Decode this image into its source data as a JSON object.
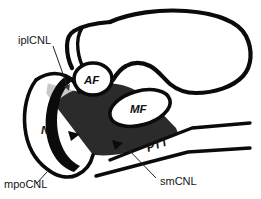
{
  "figure": {
    "background_color": "#ffffff",
    "ink_color": "#0b0b0b",
    "width": 261,
    "height": 199
  },
  "labels": {
    "iplcnl": {
      "text": "iplCNL",
      "full_name": "inferomedial plantar calcaneonavicular ligament",
      "style": "upright",
      "color": "#151515"
    },
    "mpocnl": {
      "text": "mpoCNL",
      "full_name": "medial plantar oblique calcaneonavicular ligament",
      "style": "upright",
      "color": "#151515"
    },
    "smcnl": {
      "text": "smCNL",
      "full_name": "superomedial calcaneonavicular ligament",
      "style": "upright",
      "color": "#151515"
    },
    "ptt": {
      "text": "PTT",
      "full_name": "posterior tibial tendon",
      "style": "italic-bold-rotated",
      "color": "#111111"
    },
    "af": {
      "text": "AF",
      "full_name": "anterior facet",
      "style": "italic-bold",
      "color": "#111111"
    },
    "mf": {
      "text": "MF",
      "full_name": "middle facet",
      "style": "italic-bold",
      "color": "#111111"
    },
    "n": {
      "text": "N",
      "full_name": "navicular",
      "style": "italic-bold",
      "color": "#111111"
    }
  },
  "regions": {
    "dark_shaded": {
      "name": "superomedial-calcaneonavicular-ligament-surface",
      "fill": "#2b2b2b",
      "description": "dark gray shaded articular/ligament surface"
    },
    "light_shaded": {
      "name": "inferomedial-plantar-band",
      "fill": "#c9c9c9",
      "description": "light gray band of the iplCNL"
    },
    "black_band": {
      "name": "navicular-articular-black-band",
      "fill": "#0b0b0b",
      "description": "thick black crescent band along navicular"
    }
  },
  "markers": {
    "arrowhead_count": 2,
    "arrowhead_color": "#0b0b0b",
    "pointer_arrow_color": "#3a3a3a"
  }
}
